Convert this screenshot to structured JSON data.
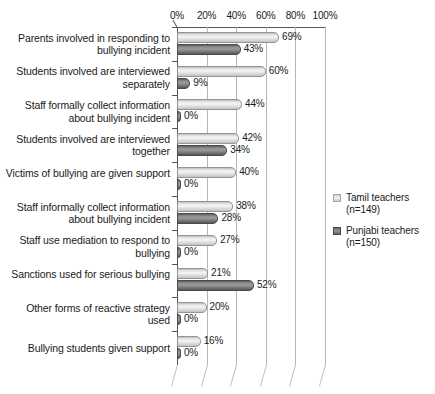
{
  "chart_data": {
    "type": "bar",
    "orientation": "horizontal",
    "title": "",
    "xlabel": "",
    "ylabel": "",
    "xlim": [
      0,
      100
    ],
    "xticks": [
      "0%",
      "20%",
      "40%",
      "60%",
      "80%",
      "100%"
    ],
    "xtick_values": [
      0,
      20,
      40,
      60,
      80,
      100
    ],
    "grid": true,
    "legend_position": "right",
    "value_suffix": "%",
    "categories": [
      "Parents involved in responding to bullying incident",
      "Students involved are interviewed separately",
      "Staff formally collect information about bullying incident",
      "Students involved are interviewed together",
      "Victims of bullying are given support",
      "Staff informally collect information about bullying incident",
      "Staff use mediation to respond to bullying",
      "Sanctions used for serious bullying",
      "Other forms of reactive strategy used",
      "Bullying students given support"
    ],
    "series": [
      {
        "name": "Tamil teachers (n=149)",
        "key": "tamil",
        "color": "#e4e4e4",
        "values": [
          69,
          60,
          44,
          42,
          40,
          38,
          27,
          21,
          20,
          16
        ],
        "labels": [
          "69%",
          "60%",
          "44%",
          "42%",
          "40%",
          "38%",
          "27%",
          "21%",
          "20%",
          "16%"
        ]
      },
      {
        "name": "Punjabi teachers (n=150)",
        "key": "punjabi",
        "color": "#7a7a7a",
        "values": [
          43,
          9,
          0,
          34,
          0,
          28,
          0,
          52,
          0,
          0
        ],
        "labels": [
          "43%",
          "9%",
          "0%",
          "34%",
          "0%",
          "28%",
          "0%",
          "52%",
          "0%",
          "0%"
        ]
      }
    ]
  },
  "legend": {
    "items": [
      {
        "label": "Tamil teachers",
        "sub": "(n=149)",
        "key": "tamil"
      },
      {
        "label": "Punjabi teachers",
        "sub": "(n=150)",
        "key": "punjabi"
      }
    ]
  }
}
